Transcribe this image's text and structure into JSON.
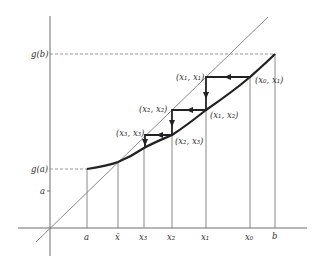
{
  "figure": {
    "type": "fixed-point-iteration-diagram",
    "y_axis_labels": {
      "gb": "g(b)",
      "ga": "g(a)",
      "a": "a"
    },
    "x_axis_labels": {
      "a": "a",
      "xbar": "x̄",
      "x3": "x₃",
      "x2": "x₂",
      "x1": "x₁",
      "x0": "x₀",
      "b": "b"
    },
    "point_labels": {
      "x1x1": "(x₁, x₁)",
      "x0x1": "(x₀, x₁)",
      "x2x2": "(x₂, x₂)",
      "x1x2": "(x₁, x₂)",
      "x3x3": "(x₃, x₃)",
      "x2x3": "(x₂, x₃)"
    },
    "colors": {
      "curve": "#222222",
      "axis": "#6e6e6e",
      "guide": "#7a7a7a",
      "text": "#333333"
    }
  }
}
